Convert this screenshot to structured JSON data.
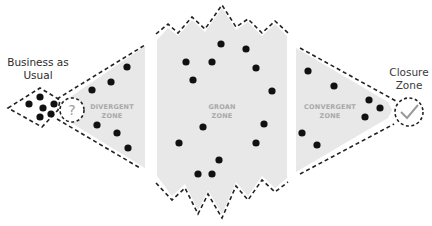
{
  "labels": {
    "business_as_usual_line1": "Business as",
    "business_as_usual_line2": "Usual",
    "closure_zone_line1": "Closure",
    "closure_zone_line2": "Zone"
  },
  "zones": {
    "divergent_line1": "DIVERGENT",
    "divergent_line2": "ZONE",
    "groan_line1": "GROAN",
    "groan_line2": "ZONE",
    "convergent_line1": "CONVERGENT",
    "convergent_line2": "ZONE"
  },
  "icons": {
    "question": "?",
    "check": "checkmark-icon"
  },
  "colors": {
    "zone_fill": "#e8e8e8",
    "dot": "#111111",
    "dash": "#222222",
    "zone_text": "#a9a9a9"
  }
}
